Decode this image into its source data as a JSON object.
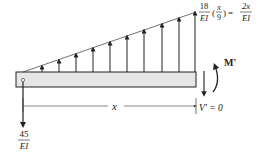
{
  "diagram": {
    "load_label": {
      "coef_num": "18",
      "coef_den": "EI",
      "paren_open": "(",
      "frac_num": "x",
      "frac_den": "9",
      "paren_close": ")",
      "equals": "=",
      "rhs_num": "2x",
      "rhs_den": "EI"
    },
    "reaction_label": {
      "num": "45",
      "den": "EI"
    },
    "moment_label": "M'",
    "shear_label": "V' = 0",
    "dimension_label": "x",
    "colors": {
      "beam_fill": "#e6e6e6",
      "stroke": "#222222"
    },
    "load_arrow_count": 10
  }
}
